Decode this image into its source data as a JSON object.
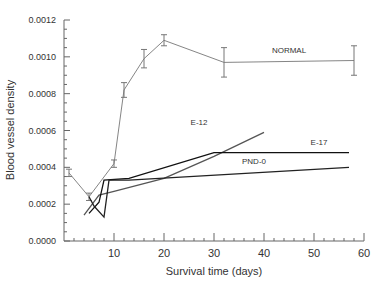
{
  "chart_data": {
    "type": "line",
    "title": "",
    "xlabel": "Survival time (days)",
    "ylabel": "Blood vessel density",
    "xlim": [
      0,
      60
    ],
    "ylim": [
      0,
      0.0012
    ],
    "x_ticks": [
      "10",
      "20",
      "30",
      "40",
      "50",
      "60"
    ],
    "y_ticks": [
      "0.0000",
      "0.0002",
      "0.0004",
      "0.0006",
      "0.0008",
      "0.0010",
      "0.0012"
    ],
    "grid": false,
    "legend_position": "inline-labels",
    "series": [
      {
        "name": "NORMAL",
        "color": "#777777",
        "error_bars": true,
        "x": [
          1,
          5,
          10,
          12,
          16,
          20,
          32,
          58
        ],
        "values": [
          0.00037,
          0.00024,
          0.00042,
          0.00082,
          0.00099,
          0.00109,
          0.00097,
          0.00098
        ],
        "errors": [
          2e-05,
          2e-05,
          2e-05,
          4e-05,
          5e-05,
          3e-05,
          8e-05,
          8e-05
        ]
      },
      {
        "name": "E-12",
        "color": "#555555",
        "error_bars": false,
        "x": [
          4,
          7,
          10,
          20,
          30,
          40
        ],
        "values": [
          0.00014,
          0.00025,
          0.00027,
          0.00034,
          0.00046,
          0.00059
        ]
      },
      {
        "name": "E-17",
        "color": "#111111",
        "error_bars": false,
        "x": [
          5,
          7,
          8,
          13,
          30,
          57
        ],
        "values": [
          0.00015,
          0.00021,
          0.00033,
          0.00034,
          0.00048,
          0.00048
        ]
      },
      {
        "name": "PND-0",
        "color": "#222222",
        "error_bars": false,
        "x": [
          5,
          6,
          8,
          9,
          13,
          57
        ],
        "values": [
          0.00024,
          0.00019,
          0.00013,
          0.00033,
          0.00033,
          0.0004
        ]
      }
    ],
    "annotations": [
      {
        "text": "NORMAL",
        "x": 45,
        "y": 0.00102
      },
      {
        "text": "E-12",
        "x": 27,
        "y": 0.00063
      },
      {
        "text": "E-17",
        "x": 51,
        "y": 0.00052
      },
      {
        "text": "PND-0",
        "x": 38,
        "y": 0.00042
      }
    ]
  }
}
